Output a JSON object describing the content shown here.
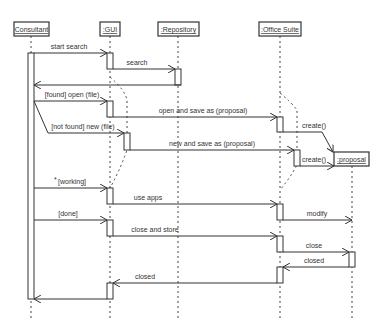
{
  "diagram": {
    "type": "uml-sequence",
    "lifelines": [
      {
        "id": "consultant",
        "label": "Consultant"
      },
      {
        "id": "gui",
        "label": ":GUI"
      },
      {
        "id": "repository",
        "label": ":Repository"
      },
      {
        "id": "office",
        "label": ":Office Suite"
      },
      {
        "id": "proposal",
        "label": ":proposal"
      }
    ],
    "messages": [
      {
        "label": "start search",
        "from": "consultant",
        "to": "gui"
      },
      {
        "label": "search",
        "from": "gui",
        "to": "repository"
      },
      {
        "label": "",
        "from": "repository",
        "to": "consultant",
        "kind": "return"
      },
      {
        "label": "[found] open (file)",
        "from": "consultant",
        "to": "gui"
      },
      {
        "label": "open and save as (proposal)",
        "from": "gui",
        "to": "office"
      },
      {
        "label": "[not found] new (file)",
        "from": "consultant",
        "to": "gui"
      },
      {
        "label": "new and save as (proposal)",
        "from": "gui",
        "to": "office"
      },
      {
        "label": "create()",
        "from": "office",
        "to": "proposal"
      },
      {
        "label": "create()",
        "from": "office",
        "to": "proposal"
      },
      {
        "label": "[working]",
        "guard_prefix": "*",
        "from": "consultant",
        "to": "gui"
      },
      {
        "label": "use apps",
        "from": "gui",
        "to": "office"
      },
      {
        "label": "modify",
        "from": "office",
        "to": "proposal"
      },
      {
        "label": "[done]",
        "from": "consultant",
        "to": "gui"
      },
      {
        "label": "close and store",
        "from": "gui",
        "to": "office"
      },
      {
        "label": "close",
        "from": "office",
        "to": "proposal"
      },
      {
        "label": "closed",
        "from": "proposal",
        "to": "office",
        "kind": "return"
      },
      {
        "label": "closed",
        "from": "office",
        "to": "gui",
        "kind": "return"
      }
    ]
  }
}
